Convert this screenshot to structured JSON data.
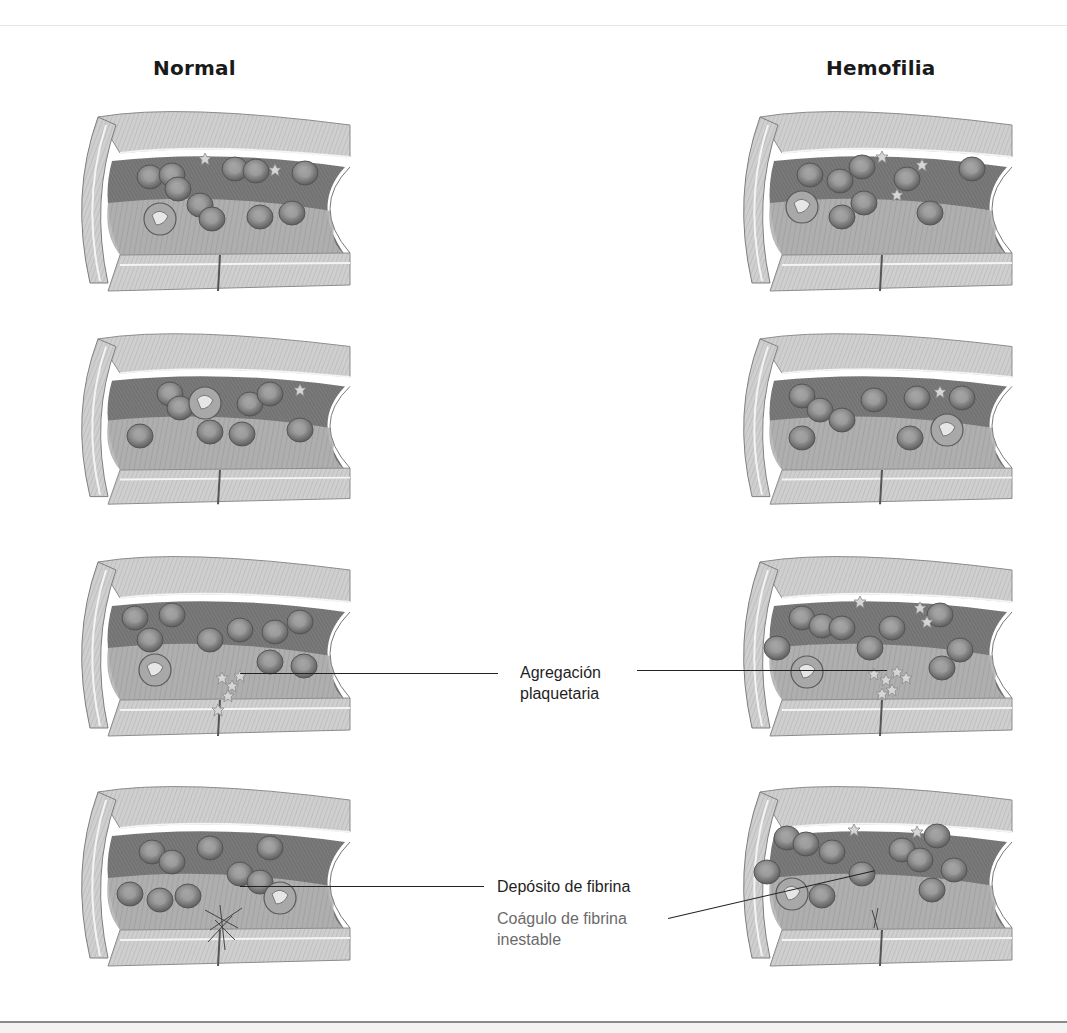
{
  "figure": {
    "columns": [
      {
        "id": "normal",
        "title": "Normal"
      },
      {
        "id": "hemofilia",
        "title": "Hemofilia"
      }
    ],
    "rows": 4,
    "panels": [
      {
        "column": "normal",
        "row": 1,
        "stage": "vessel-injury"
      },
      {
        "column": "normal",
        "row": 2,
        "stage": "vasoconstriction"
      },
      {
        "column": "normal",
        "row": 3,
        "stage": "platelet-aggregation"
      },
      {
        "column": "normal",
        "row": 4,
        "stage": "fibrin-deposit"
      },
      {
        "column": "hemofilia",
        "row": 1,
        "stage": "vessel-injury"
      },
      {
        "column": "hemofilia",
        "row": 2,
        "stage": "vasoconstriction"
      },
      {
        "column": "hemofilia",
        "row": 3,
        "stage": "platelet-aggregation"
      },
      {
        "column": "hemofilia",
        "row": 4,
        "stage": "unstable-fibrin-clot"
      }
    ],
    "callouts": {
      "aggregation": {
        "line1": "Agregación",
        "line2": "plaquetaria"
      },
      "fibrin_deposit": {
        "text": "Depósito de fibrina"
      },
      "unstable_clot": {
        "line1": "Coágulo de fibrina",
        "line2": "inestable"
      }
    },
    "colors": {
      "text_primary": "#1f1f1f",
      "text_muted": "#6b6b6b",
      "leader_line": "#222222",
      "vessel_wall": "#cfcfcf",
      "lumen_dark": "#6e6e6e",
      "cell": "#8c8c8c"
    }
  }
}
